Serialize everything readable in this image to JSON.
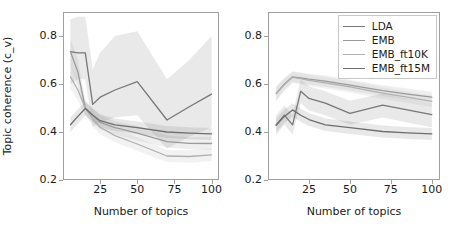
{
  "figure": {
    "y_axis_label": "Topic coherence (c_v)",
    "x_axis_label_left": "Number of topics",
    "x_axis_label_right": "Number of topics",
    "y_ticks": [
      "0.8",
      "0.6",
      "0.4",
      "0.2"
    ],
    "x_ticks": [
      "25",
      "50",
      "75",
      "100"
    ]
  },
  "legend": {
    "position": "upper-right-of-right-panel",
    "entries": [
      {
        "label": "LDA",
        "color": "#777777"
      },
      {
        "label": "EMB",
        "color": "#9a9a9a"
      },
      {
        "label": "EMB_ft10K",
        "color": "#b0b0b0"
      },
      {
        "label": "EMB_ft15M",
        "color": "#6e6e6e"
      }
    ]
  },
  "chart_data": [
    {
      "type": "line",
      "panel": "left",
      "title": "",
      "xlabel": "Number of topics",
      "ylabel": "Topic coherence (c_v)",
      "xlim": [
        0,
        105
      ],
      "ylim": [
        0.2,
        0.9
      ],
      "grid": false,
      "x": [
        5,
        10,
        15,
        20,
        25,
        35,
        50,
        70,
        85,
        100
      ],
      "series": [
        {
          "name": "LDA",
          "color": "#777777",
          "values": [
            0.735,
            0.73,
            0.73,
            0.515,
            0.545,
            0.575,
            0.61,
            0.45,
            0.505,
            0.558
          ],
          "band_low": [
            0.6,
            0.62,
            0.62,
            0.42,
            0.44,
            0.46,
            0.47,
            0.33,
            0.38,
            0.42
          ],
          "band_high": [
            0.87,
            0.88,
            0.88,
            0.66,
            0.73,
            0.8,
            0.82,
            0.62,
            0.7,
            0.8
          ]
        },
        {
          "name": "EMB",
          "color": "#9a9a9a",
          "values": [
            0.735,
            0.65,
            0.5,
            0.47,
            0.44,
            0.418,
            0.395,
            0.36,
            0.353,
            0.352
          ],
          "band_low": [
            0.68,
            0.6,
            0.47,
            0.44,
            0.41,
            0.39,
            0.365,
            0.335,
            0.328,
            0.325
          ],
          "band_high": [
            0.79,
            0.7,
            0.53,
            0.5,
            0.47,
            0.445,
            0.425,
            0.385,
            0.378,
            0.379
          ]
        },
        {
          "name": "EMB_ft10K",
          "color": "#b0b0b0",
          "values": [
            0.63,
            0.575,
            0.5,
            0.455,
            0.42,
            0.385,
            0.35,
            0.3,
            0.298,
            0.305
          ],
          "band_low": [
            0.58,
            0.53,
            0.47,
            0.425,
            0.392,
            0.357,
            0.322,
            0.275,
            0.272,
            0.278
          ],
          "band_high": [
            0.68,
            0.62,
            0.53,
            0.485,
            0.448,
            0.413,
            0.378,
            0.325,
            0.324,
            0.332
          ]
        },
        {
          "name": "EMB_ft15M",
          "color": "#6e6e6e",
          "values": [
            0.43,
            0.465,
            0.498,
            0.47,
            0.447,
            0.43,
            0.418,
            0.4,
            0.395,
            0.392
          ],
          "band_low": [
            0.4,
            0.435,
            0.47,
            0.443,
            0.42,
            0.404,
            0.392,
            0.375,
            0.37,
            0.367
          ],
          "band_high": [
            0.46,
            0.495,
            0.526,
            0.497,
            0.474,
            0.456,
            0.444,
            0.425,
            0.42,
            0.417
          ]
        }
      ]
    },
    {
      "type": "line",
      "panel": "right",
      "title": "",
      "xlabel": "Number of topics",
      "ylabel": "Topic coherence (c_v)",
      "xlim": [
        0,
        105
      ],
      "ylim": [
        0.2,
        0.9
      ],
      "grid": false,
      "x": [
        5,
        10,
        15,
        20,
        25,
        35,
        50,
        70,
        85,
        100
      ],
      "series": [
        {
          "name": "LDA",
          "color": "#777777",
          "values": [
            0.43,
            0.47,
            0.43,
            0.57,
            0.54,
            0.52,
            0.478,
            0.512,
            0.492,
            0.472
          ],
          "band_low": [
            0.39,
            0.43,
            0.39,
            0.52,
            0.49,
            0.47,
            0.43,
            0.46,
            0.44,
            0.42
          ],
          "band_high": [
            0.47,
            0.51,
            0.47,
            0.62,
            0.59,
            0.57,
            0.53,
            0.56,
            0.54,
            0.52
          ]
        },
        {
          "name": "EMB",
          "color": "#9a9a9a",
          "values": [
            0.56,
            0.6,
            0.63,
            0.625,
            0.62,
            0.612,
            0.595,
            0.572,
            0.558,
            0.545
          ],
          "band_low": [
            0.53,
            0.575,
            0.608,
            0.602,
            0.597,
            0.589,
            0.572,
            0.549,
            0.535,
            0.522
          ],
          "band_high": [
            0.59,
            0.625,
            0.652,
            0.648,
            0.643,
            0.635,
            0.618,
            0.595,
            0.581,
            0.568
          ]
        },
        {
          "name": "EMB_ft10K",
          "color": "#b0b0b0",
          "values": [
            0.56,
            0.598,
            0.628,
            0.622,
            0.615,
            0.605,
            0.588,
            0.562,
            0.545,
            0.528
          ],
          "band_low": [
            0.53,
            0.572,
            0.604,
            0.598,
            0.591,
            0.581,
            0.564,
            0.538,
            0.521,
            0.504
          ],
          "band_high": [
            0.59,
            0.624,
            0.652,
            0.646,
            0.639,
            0.629,
            0.612,
            0.586,
            0.569,
            0.552
          ]
        },
        {
          "name": "EMB_ft15M",
          "color": "#6e6e6e",
          "values": [
            0.428,
            0.465,
            0.492,
            0.47,
            0.452,
            0.43,
            0.418,
            0.402,
            0.396,
            0.392
          ],
          "band_low": [
            0.4,
            0.437,
            0.464,
            0.443,
            0.425,
            0.404,
            0.392,
            0.377,
            0.371,
            0.367
          ],
          "band_high": [
            0.456,
            0.493,
            0.52,
            0.497,
            0.479,
            0.456,
            0.444,
            0.427,
            0.421,
            0.417
          ]
        }
      ]
    }
  ]
}
